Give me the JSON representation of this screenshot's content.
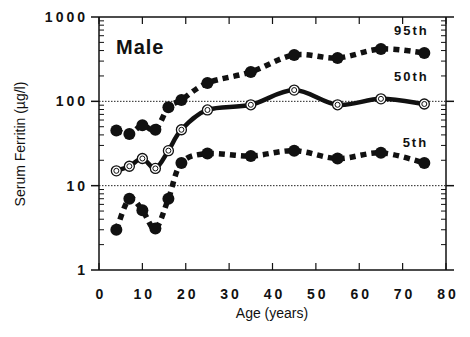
{
  "chart_data": {
    "type": "line",
    "title": "",
    "panel_label": "Male",
    "xlabel": "Age (years)",
    "ylabel": "Serum Ferritin (µg/l)",
    "xlim": [
      0,
      80
    ],
    "ylim": [
      1,
      1000
    ],
    "yscale": "log",
    "x_ticks": [
      0,
      10,
      20,
      30,
      40,
      50,
      60,
      70,
      80
    ],
    "x_tick_labels": [
      "0",
      "10",
      "20",
      "30",
      "40",
      "50",
      "60",
      "70",
      "80"
    ],
    "y_ticks": [
      1,
      10,
      100,
      1000
    ],
    "y_tick_labels": [
      "1",
      "10",
      "100",
      "1000"
    ],
    "reference_lines": [
      10,
      100
    ],
    "grid": false,
    "x": [
      4,
      7,
      10,
      13,
      16,
      19,
      25,
      35,
      45,
      55,
      65,
      75
    ],
    "series": [
      {
        "name": "95th",
        "style": "dashed",
        "marker": "filled-circle",
        "values": [
          45,
          41,
          52,
          46,
          85,
          104,
          165,
          223,
          355,
          327,
          418,
          375
        ]
      },
      {
        "name": "50th",
        "style": "solid",
        "marker": "open-circle",
        "values": [
          15,
          17,
          21,
          16,
          26,
          46,
          79,
          91,
          136,
          91,
          107,
          93
        ]
      },
      {
        "name": "5th",
        "style": "dashed",
        "marker": "filled-circle",
        "values": [
          3,
          7,
          5.1,
          3.1,
          7,
          18.6,
          24,
          22.5,
          26,
          21,
          24.5,
          18.6
        ]
      }
    ],
    "series_labels": [
      {
        "text": "95th",
        "x": 68,
        "y": 620
      },
      {
        "text": "50th",
        "x": 68,
        "y": 175
      },
      {
        "text": "5th",
        "x": 70,
        "y": 29
      }
    ]
  }
}
